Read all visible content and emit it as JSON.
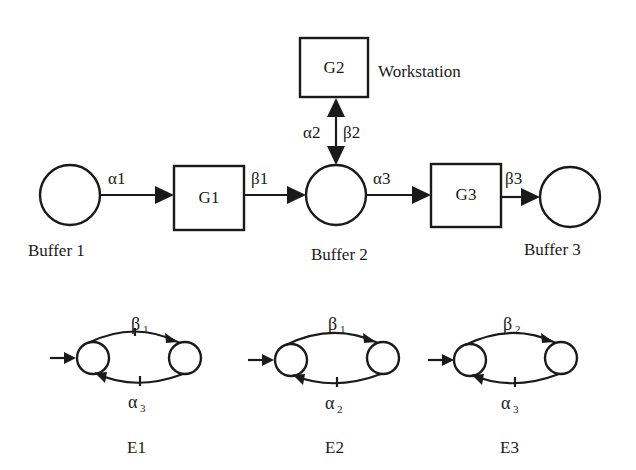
{
  "diagram": {
    "type": "manufacturing-system-with-automata",
    "colors": {
      "ink": "#1a1a1a",
      "background": "#ffffff"
    },
    "buffers": [
      {
        "id": "B1",
        "label": "Buffer 1"
      },
      {
        "id": "B2",
        "label": "Buffer 2"
      },
      {
        "id": "B3",
        "label": "Buffer 3"
      }
    ],
    "machines": [
      {
        "id": "G1",
        "label": "G1"
      },
      {
        "id": "G2",
        "label": "G2",
        "note": "Workstation"
      },
      {
        "id": "G3",
        "label": "G3"
      }
    ],
    "edges": [
      {
        "from": "Buffer 1",
        "to": "G1",
        "label": "α1"
      },
      {
        "from": "G1",
        "to": "Buffer 2",
        "label": "β1"
      },
      {
        "from": "Buffer 2",
        "to": "G2",
        "label": "α2",
        "bidirectional": true
      },
      {
        "from": "G2",
        "to": "Buffer 2",
        "label": "β2",
        "bidirectional": true
      },
      {
        "from": "Buffer 2",
        "to": "G3",
        "label": "α3"
      },
      {
        "from": "G3",
        "to": "Buffer 3",
        "label": "β3"
      }
    ],
    "automata": [
      {
        "id": "E1",
        "label": "E1",
        "top_event": "β",
        "top_sub": "1",
        "bottom_event": "α",
        "bottom_sub": "3"
      },
      {
        "id": "E2",
        "label": "E2",
        "top_event": "β",
        "top_sub": "1",
        "bottom_event": "α",
        "bottom_sub": "2"
      },
      {
        "id": "E3",
        "label": "E3",
        "top_event": "β",
        "top_sub": "2",
        "bottom_event": "α",
        "bottom_sub": "3"
      }
    ]
  }
}
